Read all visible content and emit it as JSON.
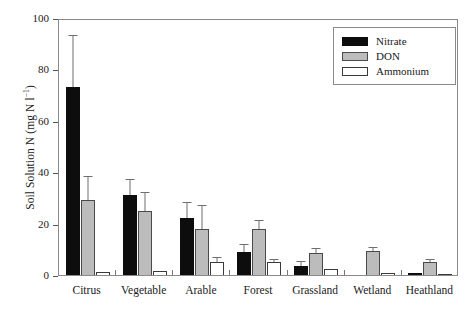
{
  "chart_data": {
    "type": "bar",
    "title": "",
    "xlabel": "",
    "ylabel": "Soil Solution N (mg N l",
    "ylabel_sup": "−1",
    "ylabel_tail": ")",
    "ylim": [
      0,
      100
    ],
    "yticks": [
      0,
      20,
      40,
      60,
      80,
      100
    ],
    "ytick_labels": [
      "0",
      "20",
      "40",
      "60",
      "80",
      "100"
    ],
    "grid": false,
    "legend_position": "top-right",
    "categories": [
      "Citrus",
      "Vegetable",
      "Arable",
      "Forest",
      "Grassland",
      "Wetland",
      "Heathland"
    ],
    "series": [
      {
        "name": "Nitrate",
        "color": "#0d0d0d",
        "values": [
          73,
          31,
          22,
          9,
          3.5,
          0,
          0.7
        ],
        "errors": [
          20,
          6,
          6,
          2.5,
          1.5,
          0,
          0
        ]
      },
      {
        "name": "DON",
        "color": "#bcbcbc",
        "values": [
          29,
          25,
          18,
          18,
          8.5,
          9.5,
          5
        ],
        "errors": [
          9,
          7,
          9,
          3,
          1.5,
          1,
          0.7
        ]
      },
      {
        "name": "Ammonium",
        "color": "#ffffff",
        "values": [
          1,
          1.5,
          5,
          5,
          2.5,
          0.6,
          0.5
        ],
        "errors": [
          0,
          0,
          1.5,
          1,
          0,
          0,
          0
        ]
      }
    ]
  },
  "legend": {
    "items": [
      {
        "label": "Nitrate",
        "key": "nitrate"
      },
      {
        "label": "DON",
        "key": "don"
      },
      {
        "label": "Ammonium",
        "key": "ammonium"
      }
    ]
  }
}
